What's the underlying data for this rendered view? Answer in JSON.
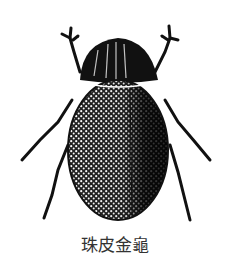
{
  "figure": {
    "caption": "珠皮金龜",
    "colors": {
      "background": "#ffffff",
      "ink": "#111111",
      "caption": "#333333"
    }
  }
}
